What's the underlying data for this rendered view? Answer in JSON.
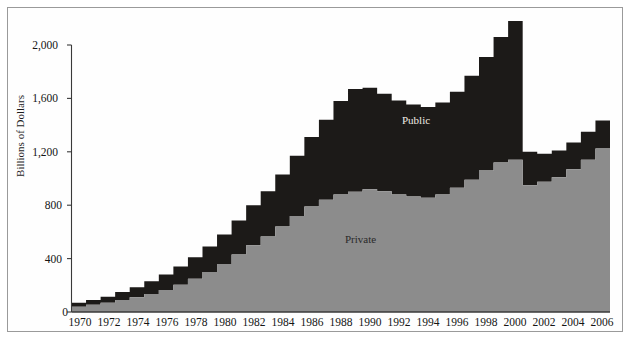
{
  "figure": {
    "background": "#ffffff",
    "frame_color": "#9a9a9a"
  },
  "axis": {
    "y_label": "Billions of Dollars",
    "y_ticks": [
      "0",
      "400",
      "800",
      "1,200",
      "1,600",
      "2,000"
    ],
    "y_tick_values": [
      0,
      400,
      800,
      1200,
      1600,
      2000
    ],
    "x_ticks": [
      "1970",
      "1972",
      "1974",
      "1976",
      "1978",
      "1980",
      "1982",
      "1984",
      "1986",
      "1988",
      "1990",
      "1992",
      "1994",
      "1996",
      "1998",
      "2000",
      "2002",
      "2004",
      "2006"
    ]
  },
  "labels": {
    "public": "Public",
    "private": "Private"
  },
  "colors": {
    "public": "#1c1a18",
    "private": "#8c8c8c",
    "axis": "#3a3a3a",
    "public_text": "#f0ece4",
    "private_text": "#2a2a2a"
  },
  "chart_data": {
    "type": "area",
    "title": "",
    "xlabel": "",
    "ylabel": "Billions of Dollars",
    "xlim": [
      1970,
      2006
    ],
    "ylim": [
      0,
      2000
    ],
    "grid": false,
    "legend": "inline-annotations",
    "stacked": true,
    "step": true,
    "x": [
      1970,
      1971,
      1972,
      1973,
      1974,
      1975,
      1976,
      1977,
      1978,
      1979,
      1980,
      1981,
      1982,
      1983,
      1984,
      1985,
      1986,
      1987,
      1988,
      1989,
      1990,
      1991,
      1992,
      1993,
      1994,
      1995,
      1996,
      1997,
      1998,
      1999,
      2000,
      2001,
      2002,
      2003,
      2004,
      2005,
      2006
    ],
    "series": [
      {
        "name": "Private",
        "values": [
          40,
          55,
          70,
          90,
          110,
          135,
          165,
          205,
          250,
          300,
          360,
          430,
          500,
          565,
          640,
          720,
          790,
          840,
          880,
          900,
          920,
          905,
          880,
          865,
          855,
          880,
          930,
          990,
          1060,
          1120,
          1140,
          950,
          975,
          1010,
          1070,
          1140,
          1225
        ]
      },
      {
        "name": "Public",
        "values": [
          30,
          35,
          45,
          60,
          75,
          95,
          115,
          135,
          160,
          190,
          220,
          255,
          300,
          340,
          390,
          450,
          520,
          600,
          700,
          770,
          760,
          730,
          705,
          690,
          680,
          690,
          720,
          780,
          850,
          940,
          1040,
          250,
          210,
          200,
          200,
          210,
          210
        ]
      }
    ],
    "totals": [
      70,
      90,
      115,
      150,
      185,
      230,
      280,
      340,
      410,
      490,
      580,
      685,
      800,
      905,
      1030,
      1170,
      1310,
      1440,
      1580,
      1670,
      1680,
      1635,
      1585,
      1555,
      1535,
      1570,
      1650,
      1770,
      1910,
      2060,
      2180,
      1200,
      1185,
      1210,
      1270,
      1350,
      1435
    ],
    "notes": {
      "peak_year": 2000,
      "peak_total": 2180,
      "post_peak_drop_year": 2001,
      "post_peak_total": 1200
    }
  }
}
